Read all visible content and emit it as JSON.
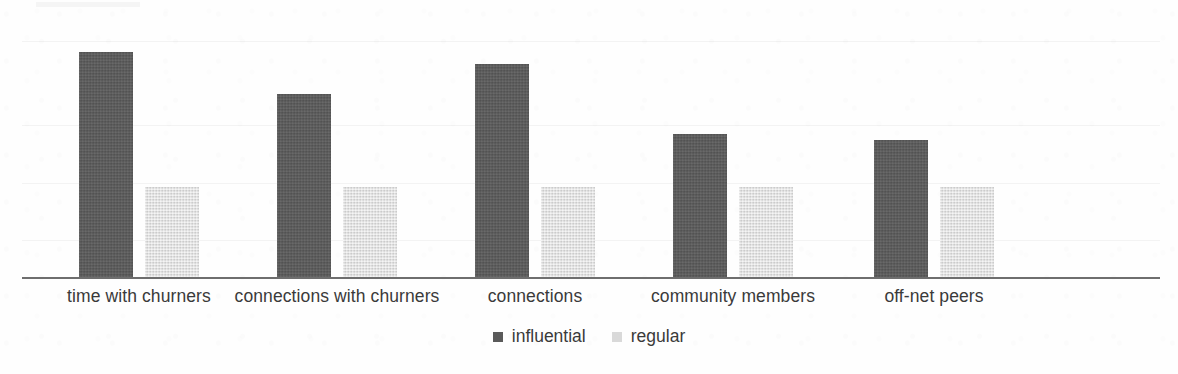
{
  "chart_data": {
    "type": "bar",
    "title": "",
    "subtitle": "",
    "xlabel": "",
    "ylabel": "",
    "grid": true,
    "legend_position": "bottom-center",
    "categories": [
      "time with churners",
      "connections with churners",
      "connections",
      "community members",
      "off-net peers"
    ],
    "series": [
      {
        "name": "influential",
        "color": "#5a5a5a",
        "values": [
          2.49,
          2.03,
          2.36,
          1.59,
          1.52
        ]
      },
      {
        "name": "regular",
        "color": "#d9d9d9",
        "values": [
          1.0,
          1.0,
          1.0,
          1.0,
          1.0
        ]
      }
    ],
    "ylim": [
      0,
      2.6
    ],
    "y_tick_labels": [],
    "note": "values normalized so that the regular group equals 1.0 for every category"
  },
  "legend": {
    "entries": [
      {
        "label": "influential",
        "swatch": "influential"
      },
      {
        "label": "regular",
        "swatch": "regular"
      }
    ]
  },
  "axis": {
    "baseline_color": "#6e6e6e",
    "gridline_color": "#f0f0f0"
  }
}
